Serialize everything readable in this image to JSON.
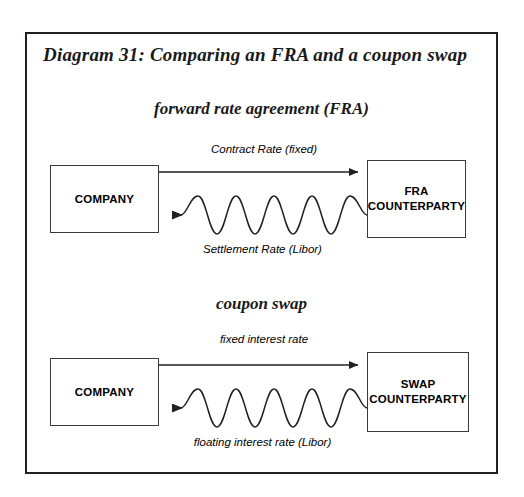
{
  "figure": {
    "title": "Diagram 31: Comparing an FRA and a coupon swap",
    "background": "#ffffff",
    "border_color": "#231f20"
  },
  "sections": [
    {
      "id": "fra",
      "heading": "forward rate agreement (FRA)",
      "left_node": "COMPANY",
      "right_node_line1": "FRA",
      "right_node_line2": "COUNTERPARTY",
      "outgoing_label": "Contract Rate (fixed)",
      "incoming_label": "Settlement Rate (Libor)"
    },
    {
      "id": "swap",
      "heading": "coupon swap",
      "left_node": "COMPANY",
      "right_node_line1": "SWAP",
      "right_node_line2": "COUNTERPARTY",
      "outgoing_label": "fixed interest rate",
      "incoming_label": "floating interest rate (Libor)"
    }
  ],
  "icons": {
    "arrow_right": "arrow-right-icon",
    "arrow_left": "arrow-left-icon",
    "wave": "wavy-line-icon"
  },
  "colors": {
    "stroke": "#231f20",
    "box_stroke": "#3a3a3a",
    "text": "#000000"
  }
}
